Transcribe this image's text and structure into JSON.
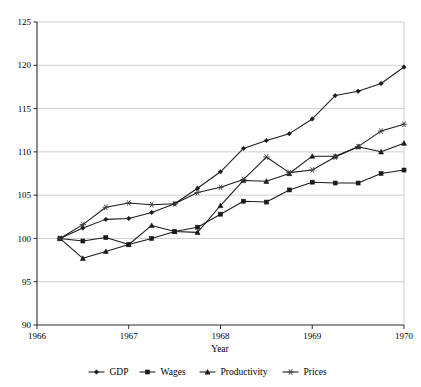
{
  "chart_data": {
    "type": "line",
    "title": "",
    "subtitle": "",
    "xlabel": "Year",
    "ylabel": "",
    "xlim": [
      1966,
      1970
    ],
    "ylim": [
      90,
      125
    ],
    "yticks": [
      90,
      95,
      100,
      105,
      110,
      115,
      120,
      125
    ],
    "xticks": [
      1966,
      1967,
      1968,
      1969,
      1970
    ],
    "xtick_labels": [
      "1966",
      "1967",
      "1968",
      "1969",
      "1970"
    ],
    "ytick_labels": [
      "90",
      "95",
      "100",
      "105",
      "110",
      "115",
      "120",
      "125"
    ],
    "grid": "horizontal",
    "legend_position": "bottom",
    "x": [
      1966.25,
      1966.5,
      1966.75,
      1967.0,
      1967.25,
      1967.5,
      1967.75,
      1968.0,
      1968.25,
      1968.5,
      1968.75,
      1969.0,
      1969.25,
      1969.5,
      1969.75,
      1970.0
    ],
    "series": [
      {
        "name": "GDP",
        "marker": "diamond",
        "color": "#1a1a1a",
        "values": [
          100.0,
          101.2,
          102.2,
          102.3,
          103.0,
          104.0,
          105.8,
          107.7,
          110.4,
          111.3,
          112.1,
          113.8,
          116.5,
          117.0,
          117.9,
          119.8
        ]
      },
      {
        "name": "Wages",
        "marker": "square",
        "color": "#1a1a1a",
        "values": [
          100.0,
          99.7,
          100.1,
          99.3,
          100.0,
          100.8,
          101.3,
          102.8,
          104.3,
          104.2,
          105.6,
          106.5,
          106.4,
          106.4,
          107.5,
          107.9
        ]
      },
      {
        "name": "Productivity",
        "marker": "triangle",
        "color": "#1a1a1a",
        "values": [
          100.0,
          97.7,
          98.5,
          99.3,
          101.5,
          100.8,
          100.7,
          103.8,
          106.7,
          106.6,
          107.5,
          109.5,
          109.5,
          110.6,
          110.0,
          111.0
        ]
      },
      {
        "name": "Prices",
        "marker": "star",
        "color": "#3c3c3c",
        "values": [
          100.0,
          101.6,
          103.6,
          104.1,
          103.9,
          104.0,
          105.3,
          105.9,
          106.8,
          109.4,
          107.6,
          107.9,
          109.4,
          110.6,
          112.4,
          113.2
        ]
      }
    ]
  },
  "axis": {
    "x_title": "Year"
  },
  "legend": {
    "items": [
      {
        "label": "GDP",
        "marker": "diamond-marker-icon"
      },
      {
        "label": "Wages",
        "marker": "square-marker-icon"
      },
      {
        "label": "Productivity",
        "marker": "triangle-marker-icon"
      },
      {
        "label": "Prices",
        "marker": "star-marker-icon"
      }
    ]
  }
}
